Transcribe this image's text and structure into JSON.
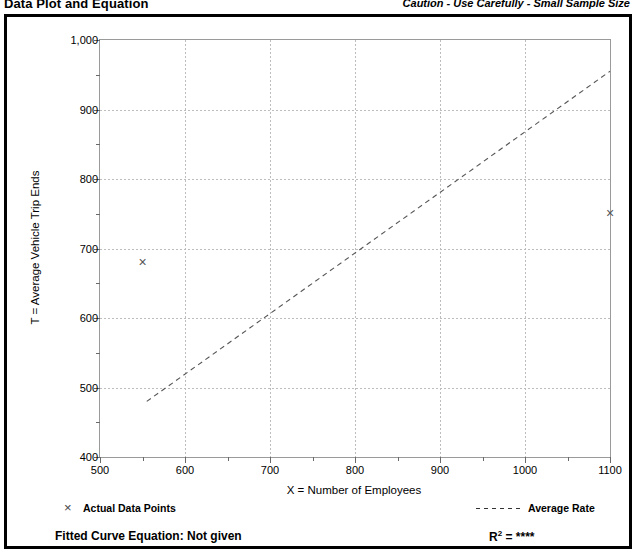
{
  "header": {
    "title": "Data Plot and Equation",
    "caution": "Caution - Use Carefully - Small Sample Size"
  },
  "footer": {
    "legend_marker_icon": "x-marker-icon",
    "legend_actual_label": "Actual Data Points",
    "legend_line_icon": "dashed-line-icon",
    "legend_average_label": "Average Rate",
    "equation_label": "Fitted Curve Equation:  Not given",
    "r2_prefix": "R",
    "r2_exponent": "2",
    "r2_value": "= ****"
  },
  "colors": {
    "frame": "#000000",
    "plot_border": "#9a9a9a",
    "gridline": "#bdbdbd",
    "marker": "#555555",
    "trendline": "#555555"
  },
  "chart_data": {
    "type": "scatter",
    "title": "Data Plot and Equation",
    "xlabel": "X = Number of Employees",
    "ylabel": "T = Average Vehicle Trip Ends",
    "xlim": [
      500,
      1100
    ],
    "ylim": [
      400,
      1000
    ],
    "xticks": [
      500,
      600,
      700,
      800,
      900,
      1000,
      1100
    ],
    "xticklabels": [
      "500",
      "600",
      "700",
      "800",
      "900",
      "1000",
      "1100"
    ],
    "xminorticks": [
      550,
      650,
      750,
      850,
      950,
      1050
    ],
    "yticks": [
      400,
      500,
      600,
      700,
      800,
      900,
      1000
    ],
    "yticklabels": [
      "400",
      "500",
      "600",
      "700",
      "800",
      "900",
      "1,000"
    ],
    "yminorticks": [
      450,
      550,
      650,
      750,
      850,
      950
    ],
    "grid": true,
    "legend_position": "below-plot",
    "series": [
      {
        "name": "Actual Data Points",
        "type": "scatter",
        "marker": "x",
        "points": [
          {
            "x": 550,
            "y": 680
          },
          {
            "x": 1100,
            "y": 750
          }
        ]
      },
      {
        "name": "Average Rate",
        "type": "line",
        "style": "dashed",
        "points": [
          {
            "x": 555,
            "y": 480
          },
          {
            "x": 1100,
            "y": 955
          }
        ]
      }
    ]
  }
}
